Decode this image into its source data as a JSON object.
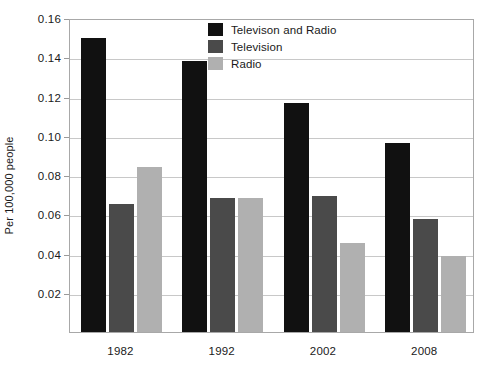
{
  "chart_data": {
    "type": "bar",
    "title": "",
    "xlabel": "",
    "ylabel": "Per 100,000 people",
    "categories": [
      "1982",
      "1992",
      "2002",
      "2008"
    ],
    "series": [
      {
        "name": "Televison and Radio",
        "color": "#111111",
        "values": [
          0.15,
          0.138,
          0.1165,
          0.0965
        ]
      },
      {
        "name": "Television",
        "color": "#4a4a4a",
        "values": [
          0.065,
          0.0685,
          0.0695,
          0.0575
        ]
      },
      {
        "name": "Radio",
        "color": "#b0b0b0",
        "values": [
          0.084,
          0.0685,
          0.0455,
          0.0385
        ]
      }
    ],
    "ylim": [
      0.0,
      0.16
    ],
    "yticks": [
      0.02,
      0.04,
      0.06,
      0.08,
      0.1,
      0.12,
      0.14,
      0.16
    ],
    "ytick_labels": [
      "0.02",
      "0.04",
      "0.06",
      "0.08",
      "0.10",
      "0.12",
      "0.14",
      "0.16"
    ],
    "grid": true,
    "grid_axis": "y",
    "legend_position": "upper-center",
    "plot_background": "#ffffff",
    "axis_color": "#a8a8a8",
    "grid_color": "#c8c8c8"
  }
}
